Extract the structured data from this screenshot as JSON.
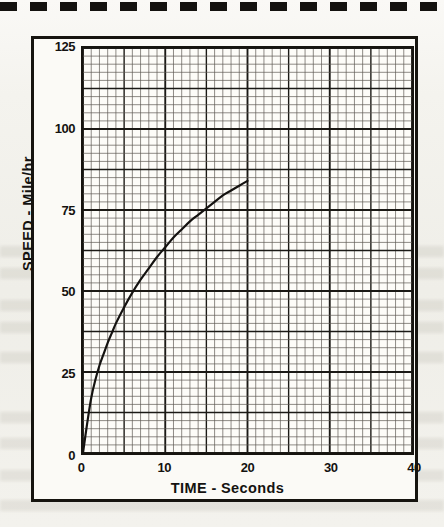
{
  "figure": {
    "paper_kind": "engineering-graph-paper",
    "top_rule_style": "dashed"
  },
  "chart_data": {
    "type": "line",
    "title": "",
    "xlabel": "TIME - Seconds",
    "ylabel": "SPEED - Mile/hr",
    "xlim": [
      0,
      40
    ],
    "ylim": [
      0,
      125
    ],
    "grid": true,
    "grid_minor_x_step": 1,
    "grid_minor_y_step": 2.5,
    "grid_major_x_step": 5,
    "grid_major_y_step": 12.5,
    "legend": "none",
    "x_ticks": [
      {
        "value": 0,
        "label": "0"
      },
      {
        "value": 10,
        "label": "10"
      },
      {
        "value": 20,
        "label": "20"
      },
      {
        "value": 30,
        "label": "30"
      },
      {
        "value": 40,
        "label": "40"
      }
    ],
    "y_ticks": [
      {
        "value": 0,
        "label": "0"
      },
      {
        "value": 25,
        "label": "25"
      },
      {
        "value": 50,
        "label": "50"
      },
      {
        "value": 75,
        "label": "75"
      },
      {
        "value": 100,
        "label": "100"
      },
      {
        "value": 125,
        "label": "125"
      }
    ],
    "series": [
      {
        "name": "speed",
        "line_color": "#141210",
        "line_width": 2,
        "x": [
          0,
          0.5,
          1,
          1.5,
          2,
          2.5,
          3,
          3.5,
          4,
          5,
          6,
          7,
          8,
          9,
          10,
          11,
          12,
          13,
          14,
          15,
          16,
          17,
          18,
          19,
          20
        ],
        "values": [
          0,
          9,
          17,
          22.5,
          27,
          30.5,
          34,
          37,
          40,
          45,
          49.5,
          53.5,
          57,
          60.5,
          63.5,
          66.5,
          69,
          71.5,
          73.5,
          75.5,
          77.5,
          79.5,
          81,
          82.5,
          84
        ]
      }
    ]
  }
}
